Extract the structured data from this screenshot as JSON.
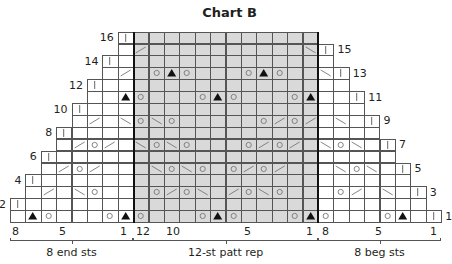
{
  "title": "Chart B",
  "grid": {
    "columns": 28,
    "rows": 16,
    "origin_x": 10,
    "bottom_y": 222,
    "cell_w": 15.4,
    "cell_h": 11.9,
    "rep_start_col": 8,
    "rep_end_col": 19,
    "rep_color": "#d9d9d9"
  },
  "row_labels": [
    {
      "row": 1,
      "text": "1",
      "side": "right"
    },
    {
      "row": 2,
      "text": "2",
      "side": "left"
    },
    {
      "row": 3,
      "text": "3",
      "side": "right"
    },
    {
      "row": 4,
      "text": "4",
      "side": "left"
    },
    {
      "row": 5,
      "text": "5",
      "side": "right"
    },
    {
      "row": 6,
      "text": "6",
      "side": "left"
    },
    {
      "row": 7,
      "text": "7",
      "side": "right"
    },
    {
      "row": 8,
      "text": "8",
      "side": "left"
    },
    {
      "row": 9,
      "text": "9",
      "side": "right"
    },
    {
      "row": 10,
      "text": "10",
      "side": "left"
    },
    {
      "row": 11,
      "text": "11",
      "side": "right"
    },
    {
      "row": 12,
      "text": "12",
      "side": "left"
    },
    {
      "row": 13,
      "text": "13",
      "side": "right"
    },
    {
      "row": 14,
      "text": "14",
      "side": "left"
    },
    {
      "row": 15,
      "text": "15",
      "side": "right"
    },
    {
      "row": 16,
      "text": "16",
      "side": "left"
    }
  ],
  "symbols_legend": {
    "yo": "yarn over (circle)",
    "k2tog": "right-slanting decrease (/)",
    "ssk": "left-slanting decrease (\\)",
    "cdd": "central double decrease (triangle)",
    "purl": "vertical bar (|)"
  },
  "stitches": [
    {
      "row": 1,
      "col": 1,
      "sym": "cdd"
    },
    {
      "row": 1,
      "col": 2,
      "sym": "yo"
    },
    {
      "row": 1,
      "col": 6,
      "sym": "yo"
    },
    {
      "row": 1,
      "col": 7,
      "sym": "cdd"
    },
    {
      "row": 1,
      "col": 8,
      "sym": "yo"
    },
    {
      "row": 1,
      "col": 12,
      "sym": "yo"
    },
    {
      "row": 1,
      "col": 13,
      "sym": "cdd"
    },
    {
      "row": 1,
      "col": 14,
      "sym": "yo"
    },
    {
      "row": 1,
      "col": 18,
      "sym": "yo"
    },
    {
      "row": 1,
      "col": 19,
      "sym": "cdd"
    },
    {
      "row": 1,
      "col": 20,
      "sym": "yo"
    },
    {
      "row": 1,
      "col": 24,
      "sym": "yo"
    },
    {
      "row": 1,
      "col": 25,
      "sym": "cdd"
    },
    {
      "row": 1,
      "col": 27,
      "sym": "purl"
    },
    {
      "row": 2,
      "col": 0,
      "sym": "purl"
    },
    {
      "row": 3,
      "col": 2,
      "sym": "k2tog"
    },
    {
      "row": 3,
      "col": 4,
      "sym": "ssk"
    },
    {
      "row": 3,
      "col": 5,
      "sym": "yo"
    },
    {
      "row": 3,
      "col": 9,
      "sym": "yo"
    },
    {
      "row": 3,
      "col": 10,
      "sym": "k2tog"
    },
    {
      "row": 3,
      "col": 11,
      "sym": "yo"
    },
    {
      "row": 3,
      "col": 12,
      "sym": "ssk"
    },
    {
      "row": 3,
      "col": 14,
      "sym": "k2tog"
    },
    {
      "row": 3,
      "col": 15,
      "sym": "yo"
    },
    {
      "row": 3,
      "col": 16,
      "sym": "ssk"
    },
    {
      "row": 3,
      "col": 17,
      "sym": "yo"
    },
    {
      "row": 3,
      "col": 21,
      "sym": "yo"
    },
    {
      "row": 3,
      "col": 22,
      "sym": "k2tog"
    },
    {
      "row": 3,
      "col": 24,
      "sym": "ssk"
    },
    {
      "row": 3,
      "col": 26,
      "sym": "purl"
    },
    {
      "row": 4,
      "col": 1,
      "sym": "purl"
    },
    {
      "row": 5,
      "col": 3,
      "sym": "k2tog"
    },
    {
      "row": 5,
      "col": 4,
      "sym": "yo"
    },
    {
      "row": 5,
      "col": 5,
      "sym": "k2tog"
    },
    {
      "row": 5,
      "col": 9,
      "sym": "ssk"
    },
    {
      "row": 5,
      "col": 10,
      "sym": "yo"
    },
    {
      "row": 5,
      "col": 11,
      "sym": "ssk"
    },
    {
      "row": 5,
      "col": 12,
      "sym": "yo"
    },
    {
      "row": 5,
      "col": 14,
      "sym": "yo"
    },
    {
      "row": 5,
      "col": 15,
      "sym": "k2tog"
    },
    {
      "row": 5,
      "col": 16,
      "sym": "yo"
    },
    {
      "row": 5,
      "col": 17,
      "sym": "k2tog"
    },
    {
      "row": 5,
      "col": 21,
      "sym": "ssk"
    },
    {
      "row": 5,
      "col": 22,
      "sym": "yo"
    },
    {
      "row": 5,
      "col": 23,
      "sym": "ssk"
    },
    {
      "row": 5,
      "col": 25,
      "sym": "purl"
    },
    {
      "row": 6,
      "col": 2,
      "sym": "purl"
    },
    {
      "row": 7,
      "col": 4,
      "sym": "k2tog"
    },
    {
      "row": 7,
      "col": 5,
      "sym": "yo"
    },
    {
      "row": 7,
      "col": 6,
      "sym": "k2tog"
    },
    {
      "row": 7,
      "col": 8,
      "sym": "ssk"
    },
    {
      "row": 7,
      "col": 9,
      "sym": "yo"
    },
    {
      "row": 7,
      "col": 10,
      "sym": "ssk"
    },
    {
      "row": 7,
      "col": 11,
      "sym": "yo"
    },
    {
      "row": 7,
      "col": 15,
      "sym": "yo"
    },
    {
      "row": 7,
      "col": 16,
      "sym": "k2tog"
    },
    {
      "row": 7,
      "col": 17,
      "sym": "yo"
    },
    {
      "row": 7,
      "col": 18,
      "sym": "k2tog"
    },
    {
      "row": 7,
      "col": 20,
      "sym": "ssk"
    },
    {
      "row": 7,
      "col": 21,
      "sym": "yo"
    },
    {
      "row": 7,
      "col": 22,
      "sym": "ssk"
    },
    {
      "row": 7,
      "col": 24,
      "sym": "purl"
    },
    {
      "row": 8,
      "col": 3,
      "sym": "purl"
    },
    {
      "row": 9,
      "col": 5,
      "sym": "k2tog"
    },
    {
      "row": 9,
      "col": 7,
      "sym": "ssk"
    },
    {
      "row": 9,
      "col": 8,
      "sym": "yo"
    },
    {
      "row": 9,
      "col": 9,
      "sym": "ssk"
    },
    {
      "row": 9,
      "col": 10,
      "sym": "yo"
    },
    {
      "row": 9,
      "col": 16,
      "sym": "yo"
    },
    {
      "row": 9,
      "col": 17,
      "sym": "k2tog"
    },
    {
      "row": 9,
      "col": 18,
      "sym": "yo"
    },
    {
      "row": 9,
      "col": 19,
      "sym": "k2tog"
    },
    {
      "row": 9,
      "col": 21,
      "sym": "ssk"
    },
    {
      "row": 9,
      "col": 23,
      "sym": "purl"
    },
    {
      "row": 10,
      "col": 4,
      "sym": "purl"
    },
    {
      "row": 11,
      "col": 7,
      "sym": "cdd"
    },
    {
      "row": 11,
      "col": 8,
      "sym": "yo"
    },
    {
      "row": 11,
      "col": 12,
      "sym": "yo"
    },
    {
      "row": 11,
      "col": 13,
      "sym": "cdd"
    },
    {
      "row": 11,
      "col": 14,
      "sym": "yo"
    },
    {
      "row": 11,
      "col": 18,
      "sym": "yo"
    },
    {
      "row": 11,
      "col": 19,
      "sym": "cdd"
    },
    {
      "row": 11,
      "col": 22,
      "sym": "purl"
    },
    {
      "row": 12,
      "col": 5,
      "sym": "purl"
    },
    {
      "row": 13,
      "col": 7,
      "sym": "k2tog"
    },
    {
      "row": 13,
      "col": 9,
      "sym": "yo"
    },
    {
      "row": 13,
      "col": 10,
      "sym": "cdd"
    },
    {
      "row": 13,
      "col": 11,
      "sym": "yo"
    },
    {
      "row": 13,
      "col": 15,
      "sym": "yo"
    },
    {
      "row": 13,
      "col": 16,
      "sym": "cdd"
    },
    {
      "row": 13,
      "col": 17,
      "sym": "yo"
    },
    {
      "row": 13,
      "col": 20,
      "sym": "ssk"
    },
    {
      "row": 13,
      "col": 21,
      "sym": "purl"
    },
    {
      "row": 14,
      "col": 6,
      "sym": "purl"
    },
    {
      "row": 15,
      "col": 8,
      "sym": "k2tog"
    },
    {
      "row": 15,
      "col": 19,
      "sym": "ssk"
    },
    {
      "row": 15,
      "col": 20,
      "sym": "purl"
    },
    {
      "row": 16,
      "col": 7,
      "sym": "purl"
    }
  ],
  "bottom_numbers": [
    {
      "text": "8",
      "x": 12
    },
    {
      "text": "5",
      "x": 59
    },
    {
      "text": "1",
      "x": 120
    },
    {
      "text": "12",
      "x": 136
    },
    {
      "text": "10",
      "x": 166
    },
    {
      "text": "5",
      "x": 244
    },
    {
      "text": "1",
      "x": 306
    },
    {
      "text": "8",
      "x": 322
    },
    {
      "text": "5",
      "x": 375
    },
    {
      "text": "1",
      "x": 430
    }
  ],
  "sections": [
    {
      "label": "8 end sts",
      "start_col": 0,
      "end_col": 7
    },
    {
      "label": "12-st patt rep",
      "start_col": 8,
      "end_col": 19
    },
    {
      "label": "8 beg sts",
      "start_col": 20,
      "end_col": 27
    }
  ]
}
